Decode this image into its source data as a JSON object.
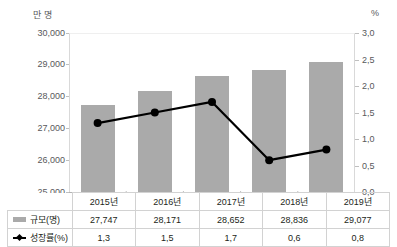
{
  "chart_data": {
    "type": "bar",
    "title": "",
    "subtitle": "",
    "xlabel": "",
    "ylabel": "만 명",
    "y2label": "%",
    "categories": [
      "2015년",
      "2016년",
      "2017년",
      "2018년",
      "2019년"
    ],
    "series": [
      {
        "name": "규모(명)",
        "type": "bar",
        "axis": "left",
        "values": [
          27747,
          28171,
          28652,
          28836,
          29077
        ],
        "labels": [
          "27,747",
          "28,171",
          "28,652",
          "28,836",
          "29,077"
        ],
        "color": "#aaaaaa"
      },
      {
        "name": "성장률(%)",
        "type": "line",
        "axis": "right",
        "values": [
          1.3,
          1.5,
          1.7,
          0.6,
          0.8
        ],
        "labels": [
          "1,3",
          "1,5",
          "1,7",
          "0,6",
          "0,8"
        ],
        "color": "#000000"
      }
    ],
    "ylim": [
      25000,
      30000
    ],
    "yticks": [
      25000,
      26000,
      27000,
      28000,
      29000,
      30000
    ],
    "ytick_labels": [
      "25,000",
      "26,000",
      "27,000",
      "28,000",
      "29,000",
      "30,000"
    ],
    "y2lim": [
      0.0,
      3.0
    ],
    "y2ticks": [
      0.0,
      0.5,
      1.0,
      1.5,
      2.0,
      2.5,
      3.0
    ],
    "y2tick_labels": [
      "0,0",
      "0,5",
      "1,0",
      "1,5",
      "2,0",
      "2,5",
      "3,0"
    ],
    "grid": false,
    "legend_position": "table-below"
  },
  "axis": {
    "left_unit": "만 명",
    "right_unit": "%"
  },
  "table": {
    "header_corner": "",
    "columns": [
      "2015년",
      "2016년",
      "2017년",
      "2018년",
      "2019년"
    ],
    "rows": [
      {
        "legend_icon": "bar-swatch-icon",
        "label": "규모(명)",
        "values": [
          "27,747",
          "28,171",
          "28,652",
          "28,836",
          "29,077"
        ]
      },
      {
        "legend_icon": "line-marker-icon",
        "label": "성장률(%)",
        "values": [
          "1,3",
          "1,5",
          "1,7",
          "0,6",
          "0,8"
        ]
      }
    ]
  },
  "colors": {
    "bar": "#aaaaaa",
    "line": "#000000",
    "axis": "#bfbfbf",
    "text": "#231f20",
    "tick_text": "#58595b",
    "table_border": "#d2d2d2"
  }
}
